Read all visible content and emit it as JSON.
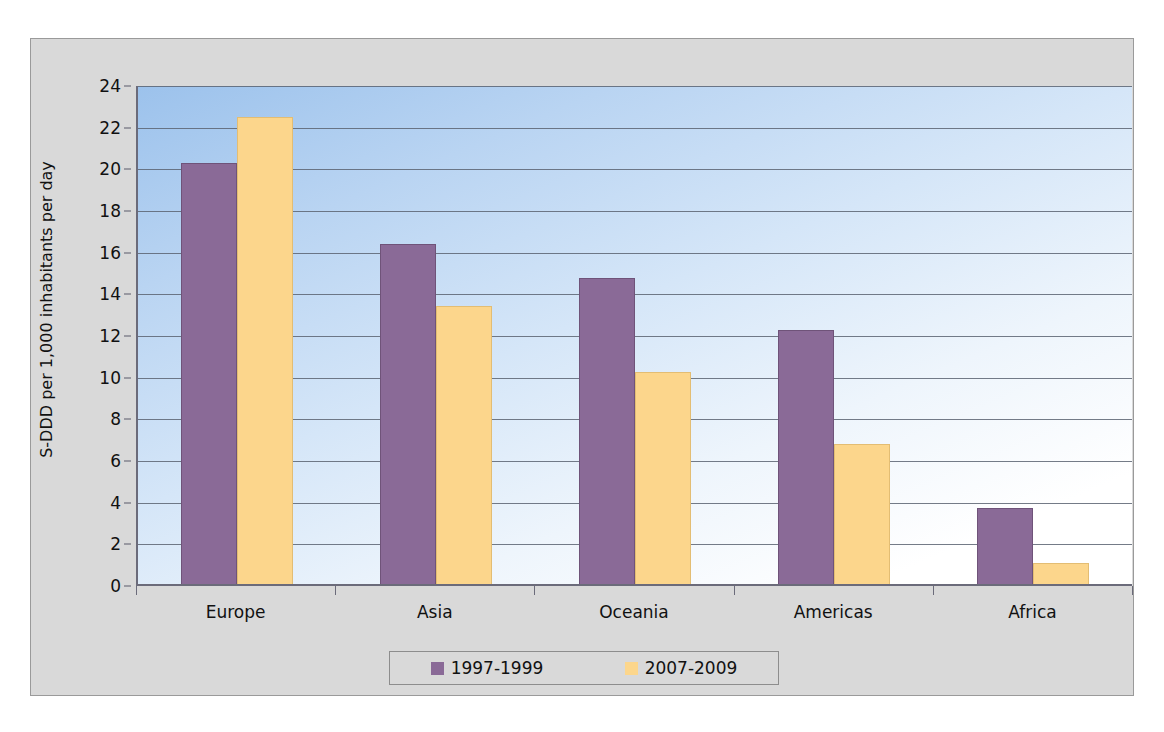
{
  "chart_data": {
    "type": "bar",
    "title": "",
    "xlabel": "",
    "ylabel": "S-DDD per 1,000 inhabitants per day",
    "categories": [
      "Europe",
      "Asia",
      "Oceania",
      "Americas",
      "Africa"
    ],
    "series": [
      {
        "name": "1997-1999",
        "color": "#8a6a97",
        "values": [
          20.2,
          16.3,
          14.7,
          12.2,
          3.65
        ]
      },
      {
        "name": "2007-2009",
        "color": "#fcd68c",
        "values": [
          22.4,
          13.35,
          10.2,
          6.7,
          1.0
        ]
      }
    ],
    "ylim": [
      0,
      24
    ],
    "ytick_step": 2,
    "yticks": [
      0,
      2,
      4,
      6,
      8,
      10,
      12,
      14,
      16,
      18,
      20,
      22,
      24
    ],
    "ytick_labels": [
      "0",
      "2",
      "4",
      "6",
      "8",
      "10",
      "12",
      "14",
      "16",
      "18",
      "20",
      "22",
      "24"
    ],
    "grid": true,
    "legend_position": "bottom",
    "plot_background": "blue-to-white gradient",
    "frame_background": "#d9d9d9"
  }
}
